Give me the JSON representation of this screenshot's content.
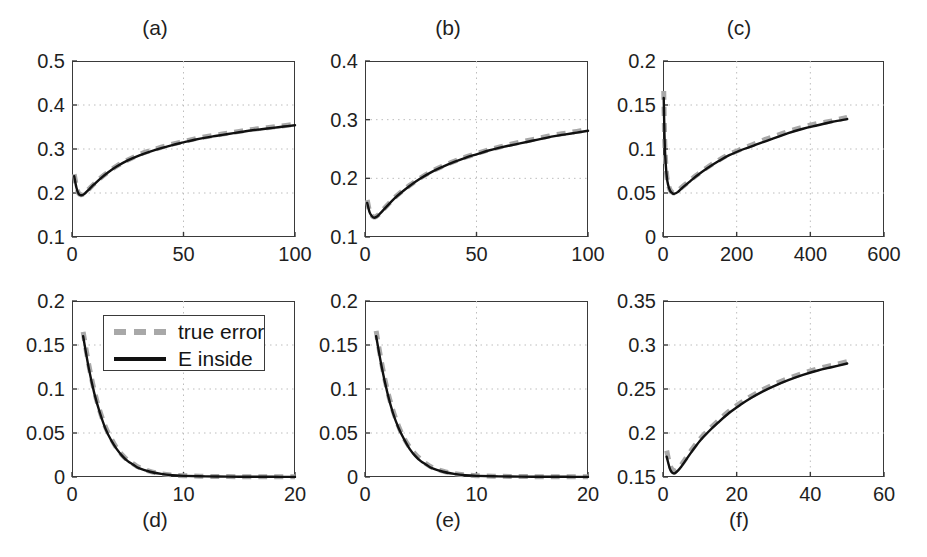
{
  "figure": {
    "background": "#ffffff",
    "axis_color": "#3a3a3a",
    "grid_color": "#bdbdbd",
    "series_colors": {
      "true_error": "#a8a8a8",
      "e_inside": "#111111"
    }
  },
  "legend": {
    "entries": [
      {
        "label": "true error",
        "style": "dashed",
        "color": "#a8a8a8"
      },
      {
        "label": "E inside",
        "style": "solid",
        "color": "#111111"
      }
    ]
  },
  "chart_data": [
    {
      "id": "a",
      "type": "line",
      "title": "(a)",
      "title_position": "top",
      "xlabel": "",
      "ylabel": "",
      "xlim": [
        0,
        100
      ],
      "ylim": [
        0.1,
        0.5
      ],
      "xticks": [
        0,
        50,
        100
      ],
      "xticklabels": [
        "0",
        "50",
        "100"
      ],
      "yticks": [
        0.1,
        0.2,
        0.3,
        0.4,
        0.5
      ],
      "yticklabels": [
        "0.1",
        "0.2",
        "0.3",
        "0.4",
        "0.5"
      ],
      "grid": true,
      "series": [
        {
          "name": "true error",
          "x": [
            1,
            2,
            3,
            4,
            5,
            6,
            8,
            10,
            13,
            16,
            20,
            25,
            30,
            35,
            40,
            45,
            50,
            55,
            60,
            65,
            70,
            75,
            80,
            85,
            90,
            95,
            100
          ],
          "values": [
            0.243,
            0.215,
            0.199,
            0.196,
            0.197,
            0.201,
            0.211,
            0.221,
            0.235,
            0.247,
            0.261,
            0.275,
            0.287,
            0.296,
            0.304,
            0.311,
            0.317,
            0.323,
            0.328,
            0.332,
            0.336,
            0.34,
            0.344,
            0.347,
            0.35,
            0.353,
            0.356
          ]
        },
        {
          "name": "E inside",
          "x": [
            1,
            2,
            3,
            4,
            5,
            6,
            8,
            10,
            13,
            16,
            20,
            25,
            30,
            35,
            40,
            45,
            50,
            55,
            60,
            65,
            70,
            75,
            80,
            85,
            90,
            95,
            100
          ],
          "values": [
            0.238,
            0.212,
            0.198,
            0.195,
            0.196,
            0.2,
            0.21,
            0.22,
            0.234,
            0.246,
            0.26,
            0.274,
            0.285,
            0.294,
            0.302,
            0.309,
            0.315,
            0.321,
            0.326,
            0.33,
            0.334,
            0.338,
            0.342,
            0.345,
            0.348,
            0.351,
            0.354
          ]
        }
      ]
    },
    {
      "id": "b",
      "type": "line",
      "title": "(b)",
      "title_position": "top",
      "xlabel": "",
      "ylabel": "",
      "xlim": [
        0,
        100
      ],
      "ylim": [
        0.1,
        0.4
      ],
      "xticks": [
        0,
        50,
        100
      ],
      "xticklabels": [
        "0",
        "50",
        "100"
      ],
      "yticks": [
        0.1,
        0.2,
        0.3,
        0.4
      ],
      "yticklabels": [
        "0.1",
        "0.2",
        "0.3",
        "0.4"
      ],
      "grid": true,
      "series": [
        {
          "name": "true error",
          "x": [
            1,
            2,
            3,
            4,
            5,
            6,
            8,
            10,
            13,
            16,
            20,
            25,
            30,
            35,
            40,
            45,
            50,
            55,
            60,
            65,
            70,
            75,
            80,
            85,
            90,
            95,
            100
          ],
          "values": [
            0.163,
            0.145,
            0.137,
            0.134,
            0.135,
            0.138,
            0.146,
            0.154,
            0.166,
            0.176,
            0.188,
            0.201,
            0.212,
            0.221,
            0.229,
            0.236,
            0.242,
            0.248,
            0.253,
            0.258,
            0.262,
            0.266,
            0.27,
            0.274,
            0.277,
            0.28,
            0.283
          ]
        },
        {
          "name": "E inside",
          "x": [
            1,
            2,
            3,
            4,
            5,
            6,
            8,
            10,
            13,
            16,
            20,
            25,
            30,
            35,
            40,
            45,
            50,
            55,
            60,
            65,
            70,
            75,
            80,
            85,
            90,
            95,
            100
          ],
          "values": [
            0.158,
            0.143,
            0.136,
            0.133,
            0.134,
            0.137,
            0.145,
            0.153,
            0.165,
            0.175,
            0.187,
            0.2,
            0.211,
            0.22,
            0.228,
            0.235,
            0.241,
            0.247,
            0.252,
            0.256,
            0.26,
            0.264,
            0.268,
            0.272,
            0.275,
            0.278,
            0.281
          ]
        }
      ]
    },
    {
      "id": "c",
      "type": "line",
      "title": "(c)",
      "title_position": "top",
      "xlabel": "",
      "ylabel": "",
      "xlim": [
        0,
        600
      ],
      "ylim": [
        0,
        0.2
      ],
      "xticks": [
        0,
        200,
        400,
        600
      ],
      "xticklabels": [
        "0",
        "200",
        "400",
        "600"
      ],
      "yticks": [
        0,
        0.05,
        0.1,
        0.15,
        0.2
      ],
      "yticklabels": [
        "0",
        "0.05",
        "0.1",
        "0.15",
        "0.2"
      ],
      "grid": true,
      "series": [
        {
          "name": "true error",
          "x": [
            2,
            4,
            6,
            9,
            12,
            16,
            20,
            25,
            30,
            40,
            50,
            70,
            90,
            120,
            150,
            180,
            220,
            260,
            300,
            340,
            380,
            420,
            460,
            500
          ],
          "values": [
            0.166,
            0.12,
            0.095,
            0.075,
            0.064,
            0.057,
            0.053,
            0.051,
            0.05,
            0.052,
            0.056,
            0.063,
            0.07,
            0.079,
            0.087,
            0.094,
            0.101,
            0.108,
            0.114,
            0.12,
            0.125,
            0.129,
            0.132,
            0.136
          ]
        },
        {
          "name": "E inside",
          "x": [
            2,
            4,
            6,
            9,
            12,
            16,
            20,
            25,
            30,
            40,
            50,
            70,
            90,
            120,
            150,
            180,
            220,
            260,
            300,
            340,
            380,
            420,
            460,
            500
          ],
          "values": [
            0.158,
            0.116,
            0.093,
            0.074,
            0.063,
            0.056,
            0.052,
            0.05,
            0.049,
            0.051,
            0.055,
            0.062,
            0.069,
            0.078,
            0.086,
            0.093,
            0.1,
            0.106,
            0.112,
            0.118,
            0.123,
            0.127,
            0.131,
            0.134
          ]
        }
      ]
    },
    {
      "id": "d",
      "type": "line",
      "title": "(d)",
      "title_position": "bottom",
      "xlabel": "",
      "ylabel": "",
      "xlim": [
        0,
        20
      ],
      "ylim": [
        0,
        0.2
      ],
      "xticks": [
        0,
        10,
        20
      ],
      "xticklabels": [
        "0",
        "10",
        "20"
      ],
      "yticks": [
        0,
        0.05,
        0.1,
        0.15,
        0.2
      ],
      "yticklabels": [
        "0",
        "0.05",
        "0.1",
        "0.15",
        "0.2"
      ],
      "grid": true,
      "series": [
        {
          "name": "true error",
          "x": [
            1,
            1.5,
            2,
            2.5,
            3,
            3.5,
            4,
            4.5,
            5,
            5.5,
            6,
            7,
            8,
            9,
            10,
            12,
            14,
            16,
            18,
            20
          ],
          "values": [
            0.165,
            0.128,
            0.098,
            0.075,
            0.057,
            0.044,
            0.033,
            0.025,
            0.019,
            0.015,
            0.011,
            0.0065,
            0.0038,
            0.0023,
            0.0015,
            0.0008,
            0.0005,
            0.0003,
            0.0002,
            0.0002
          ]
        },
        {
          "name": "E inside",
          "x": [
            1,
            1.5,
            2,
            2.5,
            3,
            3.5,
            4,
            4.5,
            5,
            5.5,
            6,
            7,
            8,
            9,
            10,
            12,
            14,
            16,
            18,
            20
          ],
          "values": [
            0.16,
            0.124,
            0.095,
            0.073,
            0.055,
            0.042,
            0.032,
            0.024,
            0.018,
            0.014,
            0.01,
            0.006,
            0.0035,
            0.002,
            0.0013,
            0.0007,
            0.0004,
            0.0003,
            0.0002,
            0.0001
          ]
        }
      ]
    },
    {
      "id": "e",
      "type": "line",
      "title": "(e)",
      "title_position": "bottom",
      "xlabel": "",
      "ylabel": "",
      "xlim": [
        0,
        20
      ],
      "ylim": [
        0,
        0.2
      ],
      "xticks": [
        0,
        10,
        20
      ],
      "xticklabels": [
        "0",
        "10",
        "20"
      ],
      "yticks": [
        0,
        0.05,
        0.1,
        0.15,
        0.2
      ],
      "yticklabels": [
        "0",
        "0.05",
        "0.1",
        "0.15",
        "0.2"
      ],
      "grid": true,
      "series": [
        {
          "name": "true error",
          "x": [
            1,
            1.5,
            2,
            2.5,
            3,
            3.5,
            4,
            4.5,
            5,
            5.5,
            6,
            7,
            8,
            9,
            10,
            12,
            14,
            16,
            18,
            20
          ],
          "values": [
            0.166,
            0.129,
            0.099,
            0.076,
            0.058,
            0.044,
            0.034,
            0.026,
            0.02,
            0.015,
            0.011,
            0.0066,
            0.0039,
            0.0024,
            0.0015,
            0.0008,
            0.0005,
            0.0003,
            0.0002,
            0.0002
          ]
        },
        {
          "name": "E inside",
          "x": [
            1,
            1.5,
            2,
            2.5,
            3,
            3.5,
            4,
            4.5,
            5,
            5.5,
            6,
            7,
            8,
            9,
            10,
            12,
            14,
            16,
            18,
            20
          ],
          "values": [
            0.16,
            0.125,
            0.096,
            0.073,
            0.056,
            0.043,
            0.032,
            0.024,
            0.018,
            0.014,
            0.01,
            0.006,
            0.0035,
            0.002,
            0.0013,
            0.0007,
            0.0004,
            0.0003,
            0.0002,
            0.0001
          ]
        }
      ]
    },
    {
      "id": "f",
      "type": "line",
      "title": "(f)",
      "title_position": "bottom",
      "xlabel": "",
      "ylabel": "",
      "xlim": [
        0,
        60
      ],
      "ylim": [
        0.15,
        0.35
      ],
      "xticks": [
        0,
        20,
        40,
        60
      ],
      "xticklabels": [
        "0",
        "20",
        "40",
        "60"
      ],
      "yticks": [
        0.15,
        0.2,
        0.25,
        0.3,
        0.35
      ],
      "yticklabels": [
        "0.15",
        "0.2",
        "0.25",
        "0.3",
        "0.35"
      ],
      "grid": true,
      "series": [
        {
          "name": "true error",
          "x": [
            1,
            2,
            3,
            4,
            5,
            6,
            8,
            10,
            12,
            15,
            18,
            21,
            24,
            27,
            30,
            34,
            38,
            42,
            46,
            50
          ],
          "values": [
            0.18,
            0.162,
            0.157,
            0.159,
            0.164,
            0.17,
            0.182,
            0.193,
            0.202,
            0.214,
            0.225,
            0.234,
            0.242,
            0.249,
            0.255,
            0.262,
            0.268,
            0.273,
            0.277,
            0.281
          ]
        },
        {
          "name": "E inside",
          "x": [
            1,
            2,
            3,
            4,
            5,
            6,
            8,
            10,
            12,
            15,
            18,
            21,
            24,
            27,
            30,
            34,
            38,
            42,
            46,
            50
          ],
          "values": [
            0.173,
            0.158,
            0.154,
            0.157,
            0.162,
            0.168,
            0.18,
            0.191,
            0.2,
            0.212,
            0.223,
            0.232,
            0.24,
            0.247,
            0.253,
            0.26,
            0.266,
            0.271,
            0.275,
            0.279
          ]
        }
      ]
    }
  ]
}
